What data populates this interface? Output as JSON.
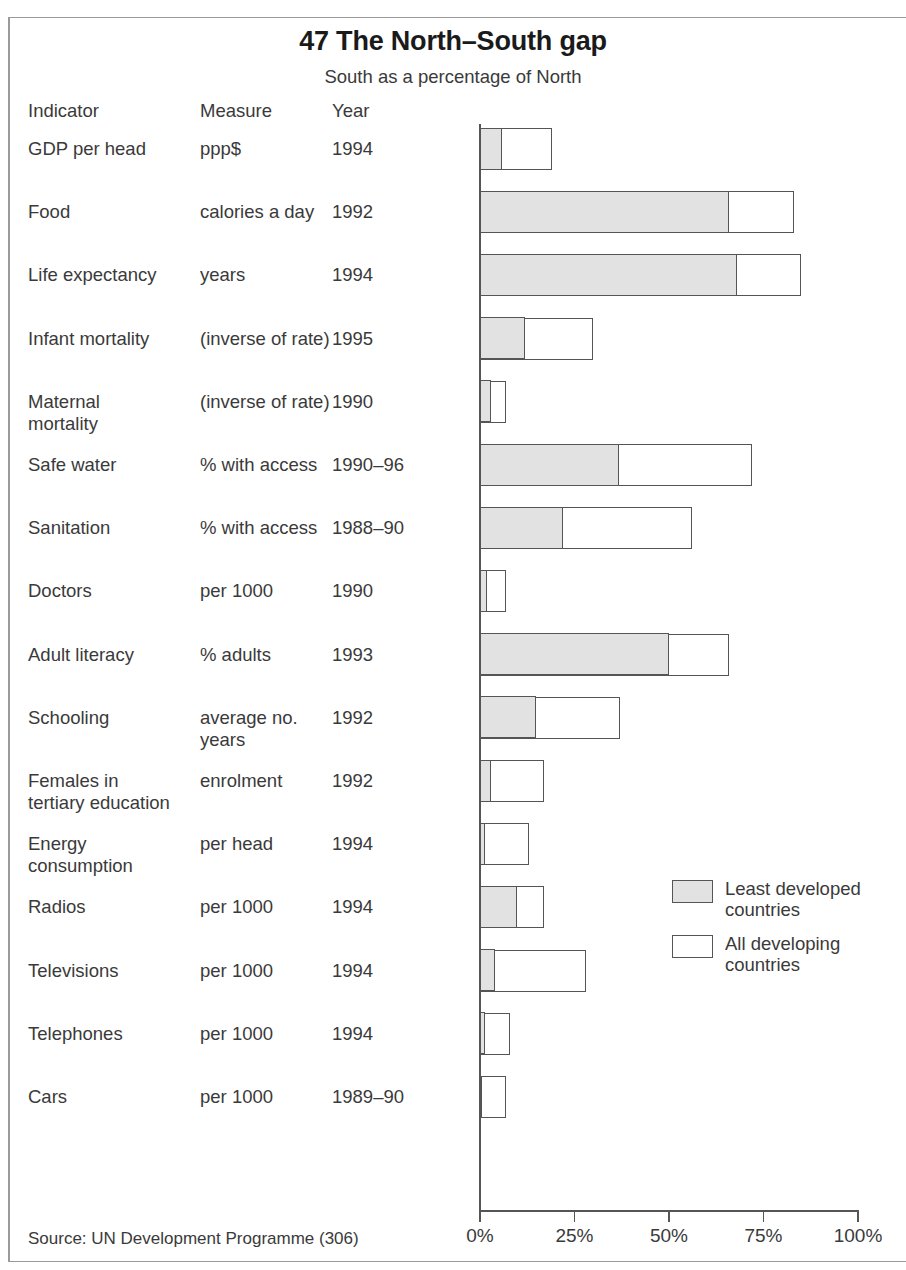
{
  "title": "47 The North–South gap",
  "subtitle": "South as a percentage of North",
  "columns": {
    "indicator": "Indicator",
    "measure": "Measure",
    "year": "Year"
  },
  "source": "Source: UN Development Programme (306)",
  "legend": {
    "items": [
      {
        "label": "Least developed\ncountries",
        "color": "#e2e2e2"
      },
      {
        "label": "All developing\ncountries",
        "color": "#ffffff"
      }
    ]
  },
  "colors": {
    "least_developed": "#e2e2e2",
    "all_developing": "#ffffff",
    "outline": "#555555",
    "text": "#3a3a3a",
    "frame": "#9a9a9a"
  },
  "chart_data": {
    "type": "bar",
    "orientation": "horizontal",
    "stacked": "overlaid",
    "title": "47 The North–South gap",
    "subtitle": "South as a percentage of North",
    "xlabel": "",
    "ylabel": "",
    "xlim": [
      0,
      100
    ],
    "xticks": [
      0,
      25,
      50,
      75,
      100
    ],
    "xticklabels": [
      "0%",
      "25%",
      "50%",
      "75%",
      "100%"
    ],
    "grid": false,
    "legend_position": "middle-right",
    "series": [
      {
        "name": "Least developed countries",
        "color": "#e2e2e2"
      },
      {
        "name": "All developing countries",
        "color": "#ffffff"
      }
    ],
    "categories": [
      "GDP per head",
      "Food",
      "Life expectancy",
      "Infant mortality",
      "Maternal mortality",
      "Safe water",
      "Sanitation",
      "Doctors",
      "Adult literacy",
      "Schooling",
      "Females in tertiary education",
      "Energy consumption",
      "Radios",
      "Televisions",
      "Telephones",
      "Cars"
    ],
    "rows": [
      {
        "indicator": "GDP per head",
        "measure": "ppp$",
        "year": "1994",
        "least_developed": 6,
        "all_developing": 19
      },
      {
        "indicator": "Food",
        "measure": "calories a day",
        "year": "1992",
        "least_developed": 66,
        "all_developing": 83
      },
      {
        "indicator": "Life expectancy",
        "measure": "years",
        "year": "1994",
        "least_developed": 68,
        "all_developing": 85
      },
      {
        "indicator": "Infant mortality",
        "measure": "(inverse of rate)",
        "year": "1995",
        "least_developed": 12,
        "all_developing": 30
      },
      {
        "indicator": "Maternal\nmortality",
        "measure": "(inverse of rate)",
        "year": "1990",
        "least_developed": 3,
        "all_developing": 7
      },
      {
        "indicator": "Safe water",
        "measure": "% with access",
        "year": "1990–96",
        "least_developed": 37,
        "all_developing": 72
      },
      {
        "indicator": "Sanitation",
        "measure": "% with access",
        "year": "1988–90",
        "least_developed": 22,
        "all_developing": 56
      },
      {
        "indicator": "Doctors",
        "measure": "per 1000",
        "year": "1990",
        "least_developed": 2,
        "all_developing": 7
      },
      {
        "indicator": "Adult literacy",
        "measure": "% adults",
        "year": "1993",
        "least_developed": 50,
        "all_developing": 66
      },
      {
        "indicator": "Schooling",
        "measure": "average no. years",
        "year": "1992",
        "least_developed": 15,
        "all_developing": 37
      },
      {
        "indicator": "Females in\ntertiary education",
        "measure": "enrolment",
        "year": "1992",
        "least_developed": 3,
        "all_developing": 17
      },
      {
        "indicator": "Energy\nconsumption",
        "measure": "per head",
        "year": "1994",
        "least_developed": 1.5,
        "all_developing": 13
      },
      {
        "indicator": "Radios",
        "measure": "per 1000",
        "year": "1994",
        "least_developed": 10,
        "all_developing": 17
      },
      {
        "indicator": "Televisions",
        "measure": "per 1000",
        "year": "1994",
        "least_developed": 4,
        "all_developing": 28
      },
      {
        "indicator": "Telephones",
        "measure": "per 1000",
        "year": "1994",
        "least_developed": 1.5,
        "all_developing": 8
      },
      {
        "indicator": "Cars",
        "measure": "per 1000",
        "year": "1989–90",
        "least_developed": 0.6,
        "all_developing": 7
      }
    ]
  }
}
